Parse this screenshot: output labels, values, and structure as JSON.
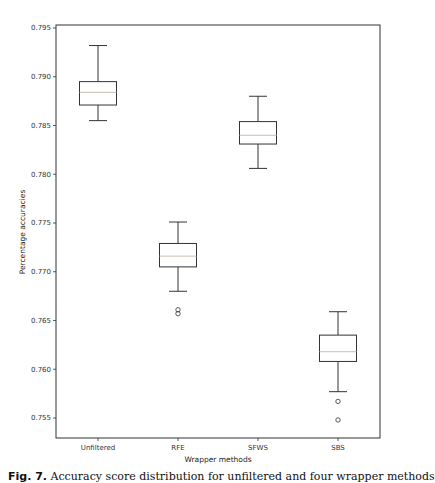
{
  "chart_data": {
    "type": "box",
    "title": "",
    "xlabel": "Wrapper methods",
    "ylabel": "Percentage accuracies",
    "ylim": [
      0.7532,
      0.7956
    ],
    "yticks": [
      0.755,
      0.76,
      0.765,
      0.77,
      0.775,
      0.78,
      0.785,
      0.79,
      0.795
    ],
    "ytick_labels": [
      "0.755",
      "0.760",
      "0.765",
      "0.770",
      "0.775",
      "0.780",
      "0.785",
      "0.790",
      "0.795"
    ],
    "grid": false,
    "categories": [
      "Unfiltered",
      "RFE",
      "SFWS",
      "SBS"
    ],
    "boxes": [
      {
        "name": "Unfiltered",
        "whisker_low": 0.7855,
        "q1": 0.7871,
        "median": 0.7884,
        "q3": 0.7895,
        "whisker_high": 0.7932,
        "outliers": []
      },
      {
        "name": "RFE",
        "whisker_low": 0.768,
        "q1": 0.7705,
        "median": 0.7716,
        "q3": 0.7729,
        "whisker_high": 0.7751,
        "outliers": [
          0.7661,
          0.7657
        ]
      },
      {
        "name": "SFWS",
        "whisker_low": 0.7806,
        "q1": 0.7831,
        "median": 0.784,
        "q3": 0.7854,
        "whisker_high": 0.788,
        "outliers": []
      },
      {
        "name": "SBS",
        "whisker_low": 0.7577,
        "q1": 0.7608,
        "median": 0.7618,
        "q3": 0.7635,
        "whisker_high": 0.7659,
        "outliers": [
          0.7567,
          0.7548
        ]
      }
    ],
    "colors": {
      "box": "#333333",
      "median": "#c9bfb0",
      "outlier": "#333333"
    }
  },
  "caption": {
    "label": "Fig. 7.",
    "text": "Accuracy score distribution for unfiltered and four wrapper methods"
  }
}
